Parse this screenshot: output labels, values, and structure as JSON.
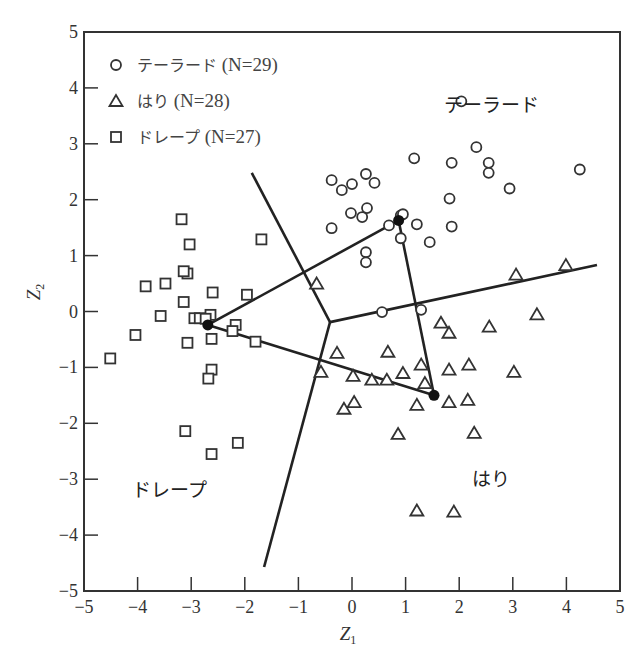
{
  "chart_data": {
    "type": "scatter",
    "title": "",
    "xlabel": "Z1",
    "ylabel": "Z2",
    "xlim": [
      -5,
      5
    ],
    "ylim": [
      -5,
      5
    ],
    "xticks": [
      -5,
      -4,
      -3,
      -2,
      -1,
      0,
      1,
      2,
      3,
      4,
      5
    ],
    "yticks": [
      -5,
      -4,
      -3,
      -2,
      -1,
      0,
      1,
      2,
      3,
      4,
      5
    ],
    "grid": false,
    "legend_position": "upper left",
    "legend": [
      {
        "marker": "circle",
        "label": "テーラード",
        "n_label": "(N=29)"
      },
      {
        "marker": "triangle",
        "label": "はり",
        "n_label": "(N=28)"
      },
      {
        "marker": "square",
        "label": "ドレープ",
        "n_label": "(N=27)"
      }
    ],
    "region_labels": [
      {
        "text": "テーラード",
        "x": 2.6,
        "y": 3.7
      },
      {
        "text": "はり",
        "x": 2.6,
        "y": -3.0
      },
      {
        "text": "ドレープ",
        "x": -3.4,
        "y": -3.2
      }
    ],
    "series": [
      {
        "name": "テーラード",
        "marker": "circle",
        "points": [
          [
            2.04,
            3.76
          ],
          [
            2.32,
            2.94
          ],
          [
            1.16,
            2.74
          ],
          [
            1.86,
            2.66
          ],
          [
            -0.38,
            2.35
          ],
          [
            -0.19,
            2.17
          ],
          [
            0.0,
            2.28
          ],
          [
            0.26,
            2.46
          ],
          [
            0.42,
            2.3
          ],
          [
            1.82,
            2.02
          ],
          [
            -0.02,
            1.76
          ],
          [
            0.19,
            1.69
          ],
          [
            0.28,
            1.85
          ],
          [
            -0.38,
            1.49
          ],
          [
            0.69,
            1.54
          ],
          [
            0.91,
            1.72
          ],
          [
            0.95,
            1.74
          ],
          [
            1.21,
            1.56
          ],
          [
            1.86,
            1.52
          ],
          [
            0.91,
            1.31
          ],
          [
            1.45,
            1.24
          ],
          [
            0.26,
            1.06
          ],
          [
            0.26,
            0.88
          ],
          [
            2.55,
            2.66
          ],
          [
            2.55,
            2.48
          ],
          [
            2.94,
            2.2
          ],
          [
            4.25,
            2.54
          ],
          [
            0.56,
            -0.01
          ],
          [
            1.29,
            0.03
          ]
        ]
      },
      {
        "name": "はり",
        "marker": "triangle",
        "points": [
          [
            -0.66,
            0.5
          ],
          [
            1.66,
            -0.2
          ],
          [
            1.81,
            -0.38
          ],
          [
            2.56,
            -0.27
          ],
          [
            -0.28,
            -0.74
          ],
          [
            0.67,
            -0.72
          ],
          [
            -0.58,
            -1.08
          ],
          [
            0.02,
            -1.15
          ],
          [
            0.37,
            -1.22
          ],
          [
            0.65,
            -1.22
          ],
          [
            0.95,
            -1.1
          ],
          [
            1.29,
            -0.95
          ],
          [
            1.81,
            -1.04
          ],
          [
            2.18,
            -0.95
          ],
          [
            1.36,
            -1.28
          ],
          [
            0.04,
            -1.62
          ],
          [
            -0.15,
            -1.74
          ],
          [
            1.21,
            -1.67
          ],
          [
            1.81,
            -1.62
          ],
          [
            2.16,
            -1.58
          ],
          [
            0.86,
            -2.19
          ],
          [
            2.28,
            -2.17
          ],
          [
            3.45,
            -0.05
          ],
          [
            3.06,
            0.66
          ],
          [
            3.99,
            0.83
          ],
          [
            3.02,
            -1.08
          ],
          [
            1.21,
            -3.56
          ],
          [
            1.9,
            -3.58
          ]
        ]
      },
      {
        "name": "ドレープ",
        "marker": "square",
        "points": [
          [
            -3.18,
            1.65
          ],
          [
            -3.03,
            1.2
          ],
          [
            -1.69,
            1.29
          ],
          [
            -3.07,
            0.68
          ],
          [
            -3.14,
            0.72
          ],
          [
            -3.85,
            0.45
          ],
          [
            -3.48,
            0.5
          ],
          [
            -2.6,
            0.34
          ],
          [
            -1.96,
            0.3
          ],
          [
            -3.14,
            0.17
          ],
          [
            -3.57,
            -0.08
          ],
          [
            -2.64,
            -0.06
          ],
          [
            -2.94,
            -0.12
          ],
          [
            -2.84,
            -0.12
          ],
          [
            -2.73,
            -0.13
          ],
          [
            -2.17,
            -0.24
          ],
          [
            -2.23,
            -0.35
          ],
          [
            -1.8,
            -0.54
          ],
          [
            -4.04,
            -0.42
          ],
          [
            -3.07,
            -0.56
          ],
          [
            -2.62,
            -0.49
          ],
          [
            -4.51,
            -0.84
          ],
          [
            -2.62,
            -1.04
          ],
          [
            -2.68,
            -1.2
          ],
          [
            -3.11,
            -2.14
          ],
          [
            -2.62,
            -2.55
          ],
          [
            -2.13,
            -2.35
          ]
        ]
      }
    ],
    "centroids": [
      {
        "group": "テーラード",
        "x": 0.87,
        "y": 1.63
      },
      {
        "group": "はり",
        "x": 1.53,
        "y": -1.5
      },
      {
        "group": "ドレープ",
        "x": -2.69,
        "y": -0.24
      }
    ],
    "boundaries": {
      "junction": [
        -0.41,
        -0.19
      ],
      "ends": [
        [
          -1.87,
          2.48
        ],
        [
          -1.64,
          -4.57
        ],
        [
          4.57,
          0.83
        ]
      ]
    }
  },
  "axis": {
    "x_title_main": "Z",
    "x_title_sub": "1",
    "y_title_main": "Z",
    "y_title_sub": "2"
  }
}
